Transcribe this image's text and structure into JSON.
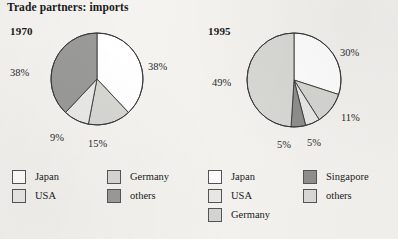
{
  "title": "Trade partners: imports",
  "colors": {
    "background": "#f4f3f0",
    "outline": "#3a3a3a",
    "japan": "#ffffff",
    "usa": "#e9e9e7",
    "germany": "#d6d6d3",
    "others_1970": "#9a9a98",
    "singapore": "#8f8f8d",
    "others_1995": "#d9d9d6"
  },
  "charts": [
    {
      "year": "1970",
      "center": {
        "x": 97,
        "y": 79
      },
      "radius": 46,
      "legend": [
        {
          "label": "Japan",
          "color": "#ffffff"
        },
        {
          "label": "Germany",
          "color": "#d6d6d3"
        },
        {
          "label": "USA",
          "color": "#e9e9e7"
        },
        {
          "label": "others",
          "color": "#9a9a98"
        }
      ],
      "labels": [
        {
          "text": "38%",
          "x": 148,
          "y": 61
        },
        {
          "text": "15%",
          "x": 88,
          "y": 138
        },
        {
          "text": "9%",
          "x": 50,
          "y": 132
        },
        {
          "text": "38%",
          "x": 10,
          "y": 67
        }
      ]
    },
    {
      "year": "1995",
      "center": {
        "x": 294,
        "y": 80
      },
      "radius": 47,
      "legend": [
        {
          "label": "Japan",
          "color": "#ffffff"
        },
        {
          "label": "USA",
          "color": "#e9e9e7"
        },
        {
          "label": "Germany",
          "color": "#d6d6d3"
        },
        {
          "label": "Singapore",
          "color": "#8f8f8d"
        },
        {
          "label": "others",
          "color": "#d9d9d6"
        }
      ],
      "labels": [
        {
          "text": "30%",
          "x": 340,
          "y": 47
        },
        {
          "text": "11%",
          "x": 341,
          "y": 112
        },
        {
          "text": "5%",
          "x": 307,
          "y": 137
        },
        {
          "text": "5%",
          "x": 277,
          "y": 139
        },
        {
          "text": "49%",
          "x": 212,
          "y": 77
        }
      ]
    }
  ],
  "chart_data": [
    {
      "type": "pie",
      "title": "1970",
      "categories": [
        "Japan",
        "Germany",
        "USA",
        "others"
      ],
      "values": [
        38,
        15,
        9,
        38
      ],
      "value_labels": [
        "38%",
        "15%",
        "9%",
        "38%"
      ],
      "unit": "percent",
      "start_angle_deg": 0,
      "direction": "clockwise",
      "colors": [
        "#ffffff",
        "#d6d6d3",
        "#e9e9e7",
        "#9a9a98"
      ],
      "legend_position": "bottom"
    },
    {
      "type": "pie",
      "title": "1995",
      "categories": [
        "Japan",
        "Germany",
        "USA",
        "Singapore",
        "others"
      ],
      "values": [
        30,
        11,
        5,
        5,
        49
      ],
      "value_labels": [
        "30%",
        "11%",
        "5%",
        "5%",
        "49%"
      ],
      "unit": "percent",
      "start_angle_deg": 0,
      "direction": "clockwise",
      "colors": [
        "#ffffff",
        "#d6d6d3",
        "#e9e9e7",
        "#8f8f8d",
        "#d9d9d6"
      ],
      "legend_position": "bottom"
    }
  ]
}
